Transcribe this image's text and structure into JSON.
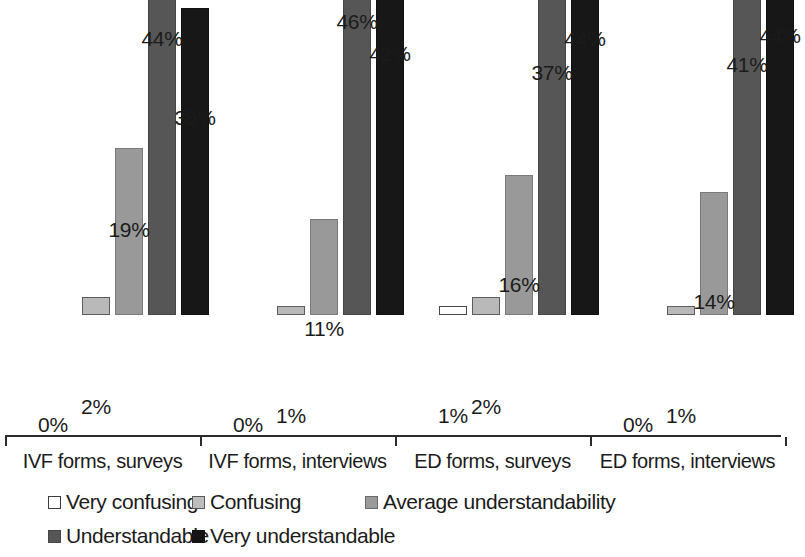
{
  "chart_data": {
    "type": "bar",
    "title": "",
    "subtitle": "",
    "xlabel": "",
    "ylabel": "",
    "ylim": [
      0,
      50
    ],
    "grid": false,
    "legend_position": "bottom",
    "value_labels": true,
    "value_label_suffix": "%",
    "categories": [
      "IVF forms, surveys",
      "IVF forms, interviews",
      "ED forms, surveys",
      "ED forms, interviews"
    ],
    "series": [
      {
        "name": "Very confusing",
        "color": "#ffffff",
        "values": [
          0,
          0,
          1,
          0
        ],
        "labels": [
          "0%",
          "0%",
          "1%",
          "0%"
        ]
      },
      {
        "name": "Confusing",
        "color": "#bdbdbd",
        "values": [
          2,
          1,
          2,
          1
        ],
        "labels": [
          "2%",
          "1%",
          "2%",
          "1%"
        ]
      },
      {
        "name": "Average understandability",
        "color": "#9a9a9a",
        "values": [
          19,
          11,
          16,
          14
        ],
        "labels": [
          "19%",
          "11%",
          "16%",
          "14%"
        ]
      },
      {
        "name": "Understandable",
        "color": "#565656",
        "values": [
          44,
          46,
          37,
          41
        ],
        "labels": [
          "44%",
          "46%",
          "37%",
          "41%"
        ]
      },
      {
        "name": "Very understandable",
        "color": "#141414",
        "values": [
          35,
          42,
          44,
          44
        ],
        "labels": [
          "35%",
          "42%",
          "44%",
          "44%"
        ]
      }
    ]
  },
  "legend": {
    "items": [
      {
        "label": "Very confusing",
        "swatch": "s0"
      },
      {
        "label": "Confusing",
        "swatch": "s1"
      },
      {
        "label": "Average understandability",
        "swatch": "s2"
      },
      {
        "label": "Understandable",
        "swatch": "s3"
      },
      {
        "label": "Very understandable",
        "swatch": "s4"
      }
    ]
  },
  "axis": {
    "categories": [
      "IVF forms, surveys",
      "IVF forms, interviews",
      "ED forms, surveys",
      "ED forms, interviews"
    ]
  }
}
